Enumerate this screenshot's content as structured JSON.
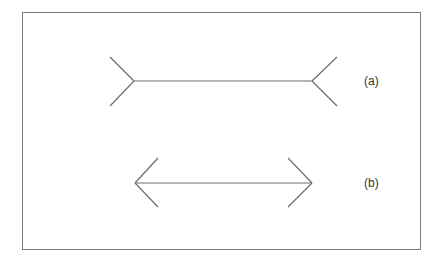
{
  "diagram": {
    "colors": {
      "line": "#6e6e6e",
      "frame": "#7a7a7a",
      "text": "#333333"
    },
    "figures": [
      {
        "id": "a",
        "label": "(a)",
        "fin_style": "outward-fins",
        "shaft_y": 81,
        "x_left": 134,
        "x_right": 312
      },
      {
        "id": "b",
        "label": "(b)",
        "fin_style": "arrowheads",
        "shaft_y": 183,
        "x_left": 135,
        "x_right": 312
      }
    ]
  }
}
